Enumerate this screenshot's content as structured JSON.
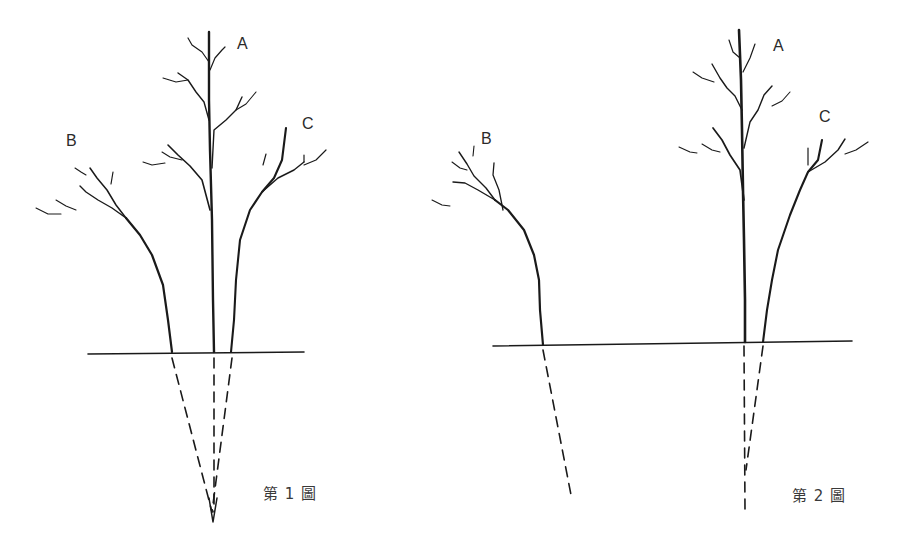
{
  "figures": [
    {
      "caption": "第 1 圖",
      "trees": [
        {
          "label": "A"
        },
        {
          "label": "B"
        },
        {
          "label": "C"
        }
      ]
    },
    {
      "caption": "第 2 圖",
      "trees": [
        {
          "label": "A"
        },
        {
          "label": "B"
        },
        {
          "label": "C"
        }
      ]
    }
  ],
  "colors": {
    "ink": "#1a1a1a",
    "background": "#ffffff"
  }
}
